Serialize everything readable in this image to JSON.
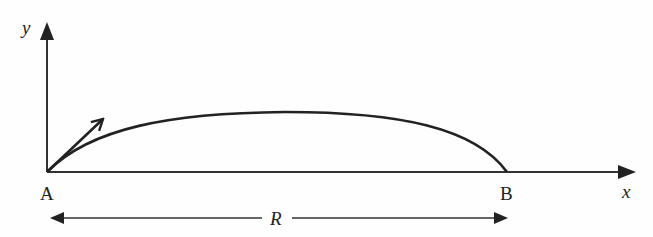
{
  "diagram": {
    "type": "projectile-trajectory",
    "axes": {
      "y_label": "y",
      "x_label": "x"
    },
    "points": {
      "start_label": "A",
      "end_label": "B"
    },
    "range_label": "R",
    "colors": {
      "stroke": "#222222",
      "background": "#fefefe"
    }
  }
}
